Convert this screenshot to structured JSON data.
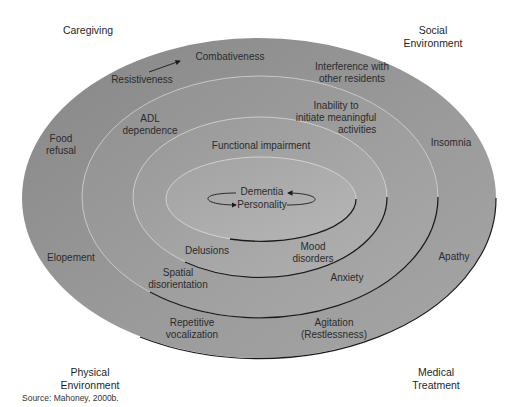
{
  "colors": {
    "outer_fill": "#8f8f8f",
    "ring3_fill": "#999999",
    "ring2_fill": "#a2a2a2",
    "ring1_fill": "#ababab",
    "light_stroke": "#d8d8d8",
    "dark_stroke": "#1a1a1a",
    "background": "#ffffff"
  },
  "corners": {
    "top_left": [
      "Caregiving"
    ],
    "top_right": [
      "Social",
      "Environment"
    ],
    "bottom_left": [
      "Physical",
      "Environment"
    ],
    "bottom_right": [
      "Medical",
      "Treatment"
    ]
  },
  "center": {
    "top": "Dementia",
    "bottom": "Personality",
    "icon": "cycle-arrows-icon"
  },
  "ring1": {
    "top": "Functional impairment",
    "bottom_left": "Delusions",
    "bottom_right": [
      "Mood",
      "disorders"
    ]
  },
  "ring2": {
    "top_left": [
      "ADL",
      "dependence"
    ],
    "top_right": [
      "Inability to",
      "initiate meaningful",
      "activities"
    ],
    "bottom_left": [
      "Spatial",
      "disorientation"
    ],
    "bottom_right": "Anxiety"
  },
  "ring3": {
    "top_left": "Resistiveness",
    "top_arrow_to": "Combativeness",
    "top_right": [
      "Interference with",
      "other residents"
    ],
    "bottom_left": [
      "Repetitive",
      "vocalization"
    ],
    "bottom_right": [
      "Agitation",
      "(Restlessness)"
    ]
  },
  "outer": {
    "left_top": [
      "Food",
      "refusal"
    ],
    "left_bottom": "Elopement",
    "right_top": "Insomnia",
    "right_bottom": "Apathy"
  },
  "source": "Source: Mahoney, 2000b."
}
